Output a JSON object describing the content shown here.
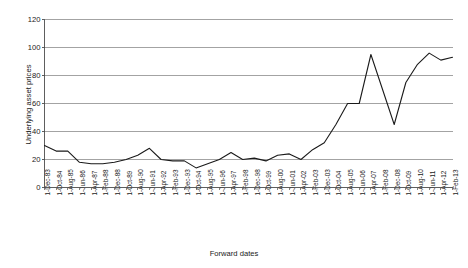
{
  "chart_data": {
    "type": "line",
    "title": "",
    "xlabel": "Forward dates",
    "ylabel": "Underlying asset prices",
    "ylim": [
      0,
      120
    ],
    "yticks": [
      0,
      20,
      40,
      60,
      80,
      100,
      120
    ],
    "grid": true,
    "legend": "none",
    "line_color": "#1a1a1a",
    "grid_color": "#8c8c8c",
    "axis_color": "#4d4d4d",
    "categories": [
      "1-Dec-83",
      "1-Oct-84",
      "1-Aug-85",
      "1-Jun-86",
      "1-Apr-87",
      "1-Feb-88",
      "1-Dec-88",
      "1-Oct-89",
      "1-Aug-90",
      "1-Jun-91",
      "1-Apr-92",
      "1-Feb-93",
      "1-Dec-93",
      "1-Oct-94",
      "1-Aug-95",
      "1-Jun-96",
      "1-Apr-97",
      "1-Feb-98",
      "1-Dec-98",
      "1-Oct-99",
      "1-Aug-00",
      "1-Jun-01",
      "1-Apr-02",
      "1-Feb-03",
      "1-Dec-03",
      "1-Oct-04",
      "1-Aug-05",
      "1-Jun-06",
      "1-Apr-07",
      "1-Feb-08",
      "1-Dec-08",
      "1-Oct-09",
      "1-Aug-10",
      "1-Jun-11",
      "1-Apr-12",
      "1-Feb-13"
    ],
    "values": [
      30,
      26,
      26,
      18,
      17,
      17,
      18,
      20,
      23,
      28,
      20,
      19,
      19,
      14,
      17,
      20,
      25,
      20,
      21,
      19,
      23,
      24,
      20,
      27,
      32,
      45,
      60,
      60,
      95,
      70,
      45,
      75,
      88,
      96,
      91,
      93
    ]
  }
}
